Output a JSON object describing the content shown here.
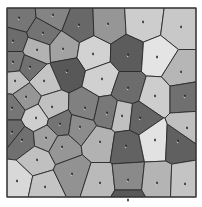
{
  "diagram": {
    "type": "voronoi",
    "frame": {
      "x": 7,
      "y": 8,
      "width": 189,
      "height": 189
    },
    "edge_color": "#2a2a2a",
    "frame_color": "#3a3a3a",
    "seed_marker_color": "#111111",
    "seed_highlight_color": "#ffffff",
    "sites": [
      {
        "x": 19,
        "y": 18,
        "g": 118
      },
      {
        "x": 53,
        "y": 15,
        "g": 132
      },
      {
        "x": 79,
        "y": 25,
        "g": 104
      },
      {
        "x": 108,
        "y": 24,
        "g": 150
      },
      {
        "x": 143,
        "y": 22,
        "g": 205
      },
      {
        "x": 181,
        "y": 27,
        "g": 200
      },
      {
        "x": 13,
        "y": 41,
        "g": 108
      },
      {
        "x": 43,
        "y": 33,
        "g": 115
      },
      {
        "x": 37,
        "y": 50,
        "g": 178
      },
      {
        "x": 63,
        "y": 49,
        "g": 162
      },
      {
        "x": 93,
        "y": 54,
        "g": 210
      },
      {
        "x": 128,
        "y": 55,
        "g": 92
      },
      {
        "x": 157,
        "y": 57,
        "g": 228
      },
      {
        "x": 181,
        "y": 72,
        "g": 182
      },
      {
        "x": 13,
        "y": 62,
        "g": 120
      },
      {
        "x": 30,
        "y": 67,
        "g": 112
      },
      {
        "x": 67,
        "y": 71,
        "g": 88
      },
      {
        "x": 102,
        "y": 79,
        "g": 208
      },
      {
        "x": 15,
        "y": 81,
        "g": 192
      },
      {
        "x": 44,
        "y": 81,
        "g": 196
      },
      {
        "x": 128,
        "y": 88,
        "g": 108
      },
      {
        "x": 155,
        "y": 96,
        "g": 205
      },
      {
        "x": 185,
        "y": 96,
        "g": 112
      },
      {
        "x": 26,
        "y": 97,
        "g": 150
      },
      {
        "x": 12,
        "y": 108,
        "g": 118
      },
      {
        "x": 52,
        "y": 107,
        "g": 192
      },
      {
        "x": 85,
        "y": 108,
        "g": 128
      },
      {
        "x": 107,
        "y": 113,
        "g": 120
      },
      {
        "x": 36,
        "y": 118,
        "g": 206
      },
      {
        "x": 60,
        "y": 124,
        "g": 116
      },
      {
        "x": 80,
        "y": 127,
        "g": 140
      },
      {
        "x": 122,
        "y": 116,
        "g": 192
      },
      {
        "x": 140,
        "y": 118,
        "g": 100
      },
      {
        "x": 12,
        "y": 132,
        "g": 108
      },
      {
        "x": 22,
        "y": 140,
        "g": 112
      },
      {
        "x": 46,
        "y": 138,
        "g": 160
      },
      {
        "x": 62,
        "y": 147,
        "g": 150
      },
      {
        "x": 100,
        "y": 142,
        "g": 178
      },
      {
        "x": 126,
        "y": 146,
        "g": 98
      },
      {
        "x": 155,
        "y": 140,
        "g": 226
      },
      {
        "x": 178,
        "y": 141,
        "g": 96
      },
      {
        "x": 187,
        "y": 128,
        "g": 192
      },
      {
        "x": 37,
        "y": 160,
        "g": 192
      },
      {
        "x": 17,
        "y": 181,
        "g": 216
      },
      {
        "x": 45,
        "y": 187,
        "g": 196
      },
      {
        "x": 72,
        "y": 174,
        "g": 146
      },
      {
        "x": 100,
        "y": 183,
        "g": 186
      },
      {
        "x": 128,
        "y": 180,
        "g": 138
      },
      {
        "x": 128,
        "y": 200,
        "g": 88
      },
      {
        "x": 157,
        "y": 183,
        "g": 180
      },
      {
        "x": 185,
        "y": 184,
        "g": 196
      }
    ]
  }
}
